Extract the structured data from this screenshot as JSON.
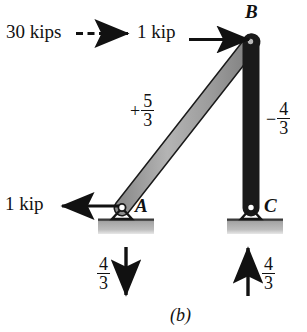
{
  "figure": {
    "caption": "(b)",
    "joints": [
      {
        "id": "A",
        "label": "A",
        "support": "pin"
      },
      {
        "id": "B",
        "label": "B",
        "support": "none"
      },
      {
        "id": "C",
        "label": "C",
        "support": "pin"
      }
    ],
    "members": [
      {
        "id": "AB",
        "from": "A",
        "to": "B",
        "force_sign": "+",
        "force_numerator": "5",
        "force_denominator": "3"
      },
      {
        "id": "BC",
        "from": "B",
        "to": "C",
        "force_sign": "−",
        "force_numerator": "4",
        "force_denominator": "3"
      }
    ],
    "loads": [
      {
        "id": "applied-30kips",
        "label": "30 kips",
        "arrow": "dashed-right"
      },
      {
        "id": "applied-1kip-top",
        "label": "1 kip",
        "arrow": "solid-right",
        "at": "B"
      },
      {
        "id": "applied-1kip-left",
        "label": "1 kip",
        "arrow": "solid-left",
        "at": "A"
      }
    ],
    "reactions": [
      {
        "id": "reaction-A",
        "numerator": "4",
        "denominator": "3",
        "arrow": "down",
        "at": "A"
      },
      {
        "id": "reaction-C",
        "numerator": "4",
        "denominator": "3",
        "arrow": "up",
        "at": "C"
      }
    ],
    "colors": {
      "member_fill": "#9a9a9a",
      "member_stroke": "#1a1a1a",
      "ground_fill": "#a8a8a8",
      "ink": "#111111"
    }
  }
}
